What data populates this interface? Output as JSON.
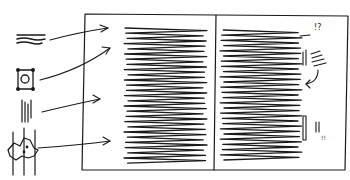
{
  "diagram": {
    "legend_items": [
      {
        "name": "heading-text",
        "icon": "wavy-lines-icon"
      },
      {
        "name": "image",
        "icon": "framed-picture-icon"
      },
      {
        "name": "vertical-text",
        "icon": "vertical-text-icon"
      },
      {
        "name": "figure",
        "icon": "map-figure-icon"
      }
    ],
    "annotations": {
      "top_mark": "!?",
      "bottom_mark": "!!"
    }
  }
}
